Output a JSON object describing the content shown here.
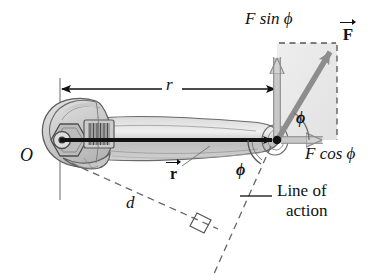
{
  "labels": {
    "pivot": "O",
    "lever_arm": "r",
    "position_vector": "r",
    "force_vector": "F",
    "force_y_component": "F sin ϕ",
    "force_x_component": "F cos ϕ",
    "angle_upper": "ϕ",
    "angle_lower": "ϕ",
    "moment_arm": "d",
    "line_of_action_1": "Line of",
    "line_of_action_2": "action"
  },
  "colors": {
    "ink": "#111111",
    "vector_gray": "#8d8d8d",
    "component_arrow_fill": "#cfcfcf",
    "component_arrow_stroke": "#8a8a8a",
    "shade_box": "#e6e6e6",
    "wrench_light": "#d8d8d8",
    "wrench_mid": "#c2c2c2",
    "wrench_dark": "#9a9a9a",
    "wrench_outline": "#5a5a5a",
    "dashed": "#6f6f6f",
    "background": "#ffffff"
  },
  "geometry": {
    "pivot_point": [
      60,
      140
    ],
    "force_point": [
      277,
      140
    ],
    "force_tip": [
      337,
      43
    ],
    "rect_right_x": 337,
    "rect_top_y": 43,
    "r_dimension_y": 89,
    "angle_degrees": 58,
    "perp_foot": [
      206,
      221
    ]
  },
  "icons": {
    "wrench": "adjustable-wrench-icon",
    "right_angle": "right-angle-marker-icon",
    "arrowhead": "arrowhead-icon"
  }
}
